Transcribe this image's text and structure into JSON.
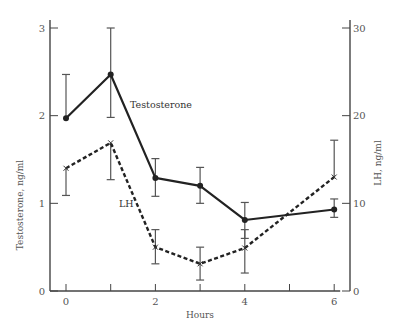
{
  "chart_data": {
    "type": "line",
    "title": "",
    "xlabel": "Hours",
    "ylabel": "Testosterone, ng/ml",
    "y2label": "LH, ng/ml",
    "x": [
      0,
      1,
      2,
      3,
      4,
      6
    ],
    "xticks": [
      0,
      1,
      2,
      3,
      4,
      5,
      6
    ],
    "xtick_labels": [
      "0",
      "",
      "2",
      "",
      "4",
      "",
      "6"
    ],
    "xlim": [
      -0.3,
      6.3
    ],
    "ylim": [
      0,
      3
    ],
    "yticks": [
      0,
      1,
      2,
      3
    ],
    "y2lim": [
      0,
      30
    ],
    "y2ticks": [
      0,
      10,
      20,
      30
    ],
    "grid": false,
    "legend": "inline labels",
    "series": [
      {
        "name": "Testosterone",
        "axis": "left",
        "style": "solid",
        "marker": "dot",
        "color": "#222222",
        "values": [
          1.97,
          2.47,
          1.29,
          1.2,
          0.81,
          0.93
        ],
        "error_high": [
          2.47,
          3.0,
          1.51,
          1.41,
          1.01,
          1.05
        ],
        "error_low": [
          null,
          1.98,
          1.08,
          1.0,
          0.6,
          0.84
        ]
      },
      {
        "name": "LH",
        "axis": "right",
        "style": "dashed",
        "marker": "x",
        "color": "#222222",
        "values": [
          14.0,
          16.9,
          5.0,
          3.1,
          4.9,
          13.0
        ],
        "error_high": [
          null,
          null,
          7.0,
          5.0,
          7.0,
          17.2
        ],
        "error_low": [
          10.9,
          12.7,
          3.1,
          1.25,
          2.05,
          null
        ]
      }
    ],
    "annotations": [
      {
        "text": "Testosterone",
        "x": 1.5,
        "y": 2.12
      },
      {
        "text": "LH",
        "x": 1.25,
        "y": 1.0
      }
    ]
  }
}
